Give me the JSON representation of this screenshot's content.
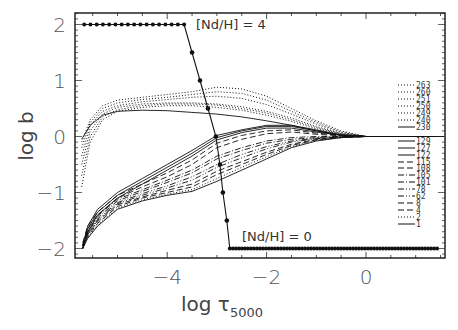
{
  "chart_data": {
    "type": "line",
    "title": "",
    "xlabel": "log τ",
    "xlabel_subscript": "5000",
    "ylabel": "log b",
    "xlim": [
      -5.86,
      1.63
    ],
    "ylim": [
      -2.2,
      2.2
    ],
    "grid": false,
    "x_ticks": [
      -4,
      -2,
      0
    ],
    "x_tick_labels": [
      "−4",
      "−2",
      "0"
    ],
    "y_ticks": [
      2,
      1,
      0,
      -1,
      -2
    ],
    "y_tick_labels": [
      "2",
      "1",
      "0",
      "−1",
      "−2"
    ],
    "annotations": [
      {
        "text": "[Nd/H] = 4",
        "x": -3.2,
        "y": 2.0
      },
      {
        "text": "[Nd/H] = 0",
        "x": -2.5,
        "y": -1.75
      }
    ],
    "abundance_profile": {
      "name": "[Nd/H] step profile",
      "style": "solid-with-dots",
      "x": [
        -5.67,
        -3.66,
        -3.5,
        -3.34,
        -3.18,
        -3.02,
        -2.94,
        -2.88,
        -2.8,
        -2.74,
        1.43
      ],
      "y": [
        2.0,
        2.0,
        1.5,
        1.0,
        0.5,
        0.0,
        -0.5,
        -1.0,
        -1.5,
        -2.0,
        -2.0
      ],
      "upper_plateau": {
        "x_start": -5.67,
        "x_end": -3.66,
        "y": 2.0,
        "n_dots": 17
      },
      "lower_plateau": {
        "x_start": -2.74,
        "x_end": 1.43,
        "y": -2.0,
        "n_dots": 70
      }
    },
    "legend": {
      "position": "right-inside",
      "entries": [
        {
          "label": "263",
          "style": "dotted",
          "group": "upper"
        },
        {
          "label": "260",
          "style": "dotted",
          "group": "upper"
        },
        {
          "label": "251",
          "style": "dotted",
          "group": "upper"
        },
        {
          "label": "250",
          "style": "dotted",
          "group": "upper"
        },
        {
          "label": "249",
          "style": "dotted",
          "group": "upper"
        },
        {
          "label": "240",
          "style": "dotted",
          "group": "upper"
        },
        {
          "label": "230",
          "style": "solid",
          "group": "upper"
        },
        {
          "label": "129",
          "style": "solid",
          "group": "lower"
        },
        {
          "label": "127",
          "style": "solid",
          "group": "lower"
        },
        {
          "label": "122",
          "style": "solid",
          "group": "lower"
        },
        {
          "label": "115",
          "style": "dashed",
          "group": "lower"
        },
        {
          "label": "108",
          "style": "dashed",
          "group": "lower"
        },
        {
          "label": "105",
          "style": "dash-dot",
          "group": "lower"
        },
        {
          "label": "101",
          "style": "dash-dot",
          "group": "lower"
        },
        {
          "label": "78",
          "style": "dash-dot-dot",
          "group": "lower"
        },
        {
          "label": "62",
          "style": "dash-dot-dot",
          "group": "lower"
        },
        {
          "label": "8",
          "style": "dashed",
          "group": "lower"
        },
        {
          "label": "4",
          "style": "dashed",
          "group": "lower"
        },
        {
          "label": "2",
          "style": "dotted",
          "group": "lower"
        },
        {
          "label": "1",
          "style": "solid",
          "group": "lower"
        }
      ]
    },
    "series": [
      {
        "name": "263",
        "style": "dotted",
        "x": [
          -5.72,
          -5.55,
          -5.3,
          -5.0,
          -4.5,
          -4.0,
          -3.5,
          -3.0,
          -2.5,
          -2.0,
          -1.5,
          -1.0,
          -0.5,
          0.0
        ],
        "y": [
          -0.1,
          0.3,
          0.55,
          0.65,
          0.7,
          0.75,
          0.8,
          0.88,
          0.85,
          0.72,
          0.5,
          0.28,
          0.1,
          0.0
        ]
      },
      {
        "name": "260",
        "style": "dotted",
        "x": [
          -5.72,
          -5.55,
          -5.3,
          -5.0,
          -4.5,
          -4.0,
          -3.5,
          -3.0,
          -2.5,
          -2.0,
          -1.5,
          -1.0,
          -0.5,
          0.0
        ],
        "y": [
          -0.2,
          0.25,
          0.5,
          0.6,
          0.66,
          0.7,
          0.75,
          0.8,
          0.77,
          0.65,
          0.45,
          0.25,
          0.08,
          0.0
        ]
      },
      {
        "name": "251",
        "style": "dotted",
        "x": [
          -5.72,
          -5.55,
          -5.3,
          -5.0,
          -4.5,
          -4.0,
          -3.5,
          -3.0,
          -2.5,
          -2.0,
          -1.5,
          -1.0,
          -0.5,
          0.0
        ],
        "y": [
          -0.35,
          0.2,
          0.45,
          0.55,
          0.62,
          0.66,
          0.7,
          0.72,
          0.68,
          0.57,
          0.4,
          0.22,
          0.07,
          0.0
        ]
      },
      {
        "name": "250",
        "style": "dotted",
        "x": [
          -5.72,
          -5.55,
          -5.3,
          -5.0,
          -4.5,
          -4.0,
          -3.5,
          -3.0,
          -2.5,
          -2.0,
          -1.5,
          -1.0,
          -0.5,
          0.0
        ],
        "y": [
          -0.5,
          0.1,
          0.4,
          0.52,
          0.58,
          0.6,
          0.6,
          0.58,
          0.53,
          0.45,
          0.33,
          0.18,
          0.05,
          0.0
        ]
      },
      {
        "name": "249",
        "style": "dotted",
        "x": [
          -5.72,
          -5.55,
          -5.3,
          -5.0,
          -4.5,
          -4.0,
          -3.5,
          -3.0,
          -2.5,
          -2.0,
          -1.5,
          -1.0,
          -0.5,
          0.0
        ],
        "y": [
          -0.7,
          0.0,
          0.35,
          0.48,
          0.55,
          0.58,
          0.58,
          0.56,
          0.5,
          0.42,
          0.3,
          0.16,
          0.05,
          0.0
        ]
      },
      {
        "name": "240",
        "style": "dotted",
        "x": [
          -5.72,
          -5.55,
          -5.3,
          -5.0,
          -4.5,
          -4.0,
          -3.5,
          -3.0,
          -2.5,
          -2.0,
          -1.5,
          -1.0,
          -0.5,
          0.0
        ],
        "y": [
          -0.9,
          -0.1,
          0.3,
          0.45,
          0.52,
          0.55,
          0.55,
          0.52,
          0.47,
          0.38,
          0.27,
          0.14,
          0.04,
          0.0
        ]
      },
      {
        "name": "230",
        "style": "solid",
        "x": [
          -5.72,
          -5.55,
          -5.3,
          -5.0,
          -4.5,
          -4.0,
          -3.5,
          -3.0,
          -2.5,
          -2.0,
          -1.5,
          -1.0,
          -0.5,
          0.0
        ],
        "y": [
          -0.05,
          0.2,
          0.38,
          0.45,
          0.47,
          0.46,
          0.43,
          0.4,
          0.35,
          0.28,
          0.2,
          0.1,
          0.03,
          0.0
        ]
      },
      {
        "name": "129",
        "style": "solid",
        "x": [
          -5.7,
          -5.6,
          -5.4,
          -5.0,
          -4.5,
          -4.0,
          -3.5,
          -3.0,
          -2.5,
          -2.0,
          -1.5,
          -1.0,
          -0.5,
          0.0
        ],
        "y": [
          -1.95,
          -1.6,
          -1.3,
          -1.0,
          -0.75,
          -0.5,
          -0.25,
          0.02,
          0.12,
          0.2,
          0.2,
          0.12,
          0.03,
          0.0
        ]
      },
      {
        "name": "127",
        "style": "solid",
        "x": [
          -5.7,
          -5.6,
          -5.4,
          -5.0,
          -4.5,
          -4.0,
          -3.5,
          -3.0,
          -2.5,
          -2.0,
          -1.5,
          -1.0,
          -0.5,
          0.0
        ],
        "y": [
          -2.0,
          -1.65,
          -1.35,
          -1.05,
          -0.8,
          -0.55,
          -0.3,
          -0.02,
          0.1,
          0.18,
          0.18,
          0.1,
          0.02,
          0.0
        ]
      },
      {
        "name": "122",
        "style": "solid",
        "x": [
          -5.7,
          -5.6,
          -5.4,
          -5.0,
          -4.5,
          -4.0,
          -3.5,
          -3.0,
          -2.5,
          -2.0,
          -1.5,
          -1.0,
          -0.5,
          0.0
        ],
        "y": [
          -2.0,
          -1.7,
          -1.4,
          -1.1,
          -0.85,
          -0.6,
          -0.35,
          -0.06,
          0.07,
          0.15,
          0.15,
          0.08,
          0.02,
          0.0
        ]
      },
      {
        "name": "115",
        "style": "dashed",
        "x": [
          -5.7,
          -5.6,
          -5.4,
          -5.0,
          -4.5,
          -4.0,
          -3.5,
          -3.0,
          -2.5,
          -2.0,
          -1.5,
          -1.0,
          -0.5,
          0.0
        ],
        "y": [
          -1.9,
          -1.6,
          -1.35,
          -1.05,
          -0.85,
          -0.65,
          -0.42,
          -0.12,
          0.02,
          0.1,
          0.12,
          0.06,
          0.02,
          0.0
        ]
      },
      {
        "name": "108",
        "style": "dashed",
        "x": [
          -5.7,
          -5.6,
          -5.4,
          -5.0,
          -4.5,
          -4.0,
          -3.5,
          -3.0,
          -2.5,
          -2.0,
          -1.5,
          -1.0,
          -0.5,
          0.0
        ],
        "y": [
          -1.95,
          -1.65,
          -1.4,
          -1.1,
          -0.9,
          -0.72,
          -0.5,
          -0.2,
          -0.05,
          0.05,
          0.08,
          0.04,
          0.01,
          0.0
        ]
      },
      {
        "name": "105",
        "style": "dash-dot",
        "x": [
          -5.7,
          -5.6,
          -5.4,
          -5.0,
          -4.5,
          -4.0,
          -3.5,
          -3.0,
          -2.5,
          -2.0,
          -1.5,
          -1.0,
          -0.5,
          0.0
        ],
        "y": [
          -1.95,
          -1.7,
          -1.42,
          -1.12,
          -0.95,
          -0.78,
          -0.6,
          -0.35,
          -0.2,
          -0.08,
          -0.02,
          0.0,
          0.0,
          0.0
        ]
      },
      {
        "name": "101",
        "style": "dash-dot",
        "x": [
          -5.7,
          -5.6,
          -5.4,
          -5.0,
          -4.5,
          -4.0,
          -3.5,
          -3.0,
          -2.5,
          -2.0,
          -1.5,
          -1.0,
          -0.5,
          0.0
        ],
        "y": [
          -2.0,
          -1.72,
          -1.45,
          -1.15,
          -0.98,
          -0.82,
          -0.65,
          -0.4,
          -0.25,
          -0.12,
          -0.05,
          -0.02,
          0.0,
          0.0
        ]
      },
      {
        "name": "78",
        "style": "dash-dot-dot",
        "x": [
          -5.7,
          -5.6,
          -5.4,
          -5.0,
          -4.5,
          -4.0,
          -3.5,
          -3.0,
          -2.5,
          -2.0,
          -1.5,
          -1.0,
          -0.5,
          0.0
        ],
        "y": [
          -1.95,
          -1.72,
          -1.48,
          -1.18,
          -1.02,
          -0.88,
          -0.72,
          -0.5,
          -0.32,
          -0.18,
          -0.08,
          -0.03,
          -0.01,
          0.0
        ]
      },
      {
        "name": "62",
        "style": "dash-dot-dot",
        "x": [
          -5.7,
          -5.6,
          -5.4,
          -5.0,
          -4.5,
          -4.0,
          -3.5,
          -3.0,
          -2.5,
          -2.0,
          -1.5,
          -1.0,
          -0.5,
          0.0
        ],
        "y": [
          -2.0,
          -1.75,
          -1.5,
          -1.2,
          -1.05,
          -0.92,
          -0.78,
          -0.55,
          -0.38,
          -0.22,
          -0.1,
          -0.04,
          -0.01,
          0.0
        ]
      },
      {
        "name": "8",
        "style": "dashed",
        "x": [
          -5.7,
          -5.6,
          -5.4,
          -5.0,
          -4.5,
          -4.0,
          -3.5,
          -3.0,
          -2.5,
          -2.0,
          -1.5,
          -1.0,
          -0.5,
          0.0
        ],
        "y": [
          -1.95,
          -1.75,
          -1.52,
          -1.22,
          -1.08,
          -0.96,
          -0.85,
          -0.62,
          -0.45,
          -0.28,
          -0.14,
          -0.05,
          -0.01,
          0.0
        ]
      },
      {
        "name": "4",
        "style": "dashed",
        "x": [
          -5.7,
          -5.6,
          -5.4,
          -5.0,
          -4.5,
          -4.0,
          -3.5,
          -3.0,
          -2.5,
          -2.0,
          -1.5,
          -1.0,
          -0.5,
          0.0
        ],
        "y": [
          -2.0,
          -1.78,
          -1.55,
          -1.25,
          -1.1,
          -1.0,
          -0.9,
          -0.68,
          -0.5,
          -0.32,
          -0.16,
          -0.06,
          -0.02,
          0.0
        ]
      },
      {
        "name": "2",
        "style": "dotted",
        "x": [
          -5.7,
          -5.6,
          -5.4,
          -5.0,
          -4.5,
          -4.0,
          -3.5,
          -3.0,
          -2.5,
          -2.0,
          -1.5,
          -1.0,
          -0.5,
          0.0
        ],
        "y": [
          -1.98,
          -1.8,
          -1.58,
          -1.28,
          -1.13,
          -1.03,
          -0.95,
          -0.75,
          -0.55,
          -0.36,
          -0.18,
          -0.07,
          -0.02,
          0.0
        ]
      },
      {
        "name": "1",
        "style": "solid",
        "x": [
          -5.7,
          -5.6,
          -5.4,
          -5.0,
          -4.5,
          -4.0,
          -3.5,
          -3.0,
          -2.5,
          -2.0,
          -1.5,
          -1.0,
          -0.5,
          0.0
        ],
        "y": [
          -2.0,
          -1.82,
          -1.6,
          -1.3,
          -1.15,
          -1.05,
          -0.98,
          -0.8,
          -0.6,
          -0.4,
          -0.2,
          -0.08,
          -0.02,
          0.0
        ]
      }
    ],
    "extra_series_note": "Multiple overlapping departure-coefficient curves converge to log b = 0 near log τ = 0 and extend flat to the right edge."
  },
  "frame": {
    "left": 75,
    "right": 445,
    "top": 13,
    "bottom": 258,
    "x_zero_px": 366,
    "x_px_per_unit": 49.7,
    "y_zero_px": 136.5,
    "y_px_per_unit": 56
  },
  "colors": {
    "line": "#111111",
    "axis": "#222222",
    "text": "#444444"
  }
}
